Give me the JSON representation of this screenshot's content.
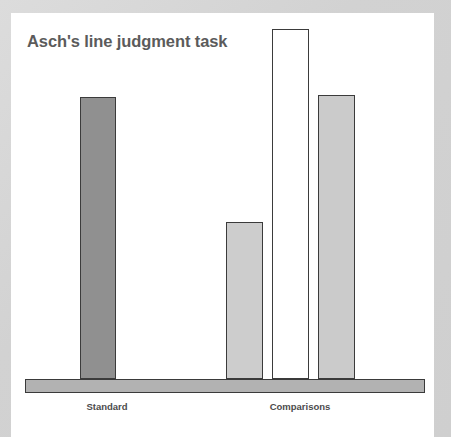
{
  "figure": {
    "title": "Asch's line judgment task",
    "title_color": "#5b5b5b",
    "card_background": "#ffffff",
    "page_background": "#d6d6d6"
  },
  "labels": {
    "standard": "Standard",
    "comparisons": "Comparisons"
  },
  "chart_data": {
    "type": "bar",
    "title": "Asch's line judgment task",
    "xlabel": "",
    "ylabel": "",
    "grid": false,
    "legend": "none",
    "groups": [
      {
        "name": "Standard",
        "label": "Standard",
        "bar_indices": [
          0
        ]
      },
      {
        "name": "Comparisons",
        "label": "Comparisons",
        "bar_indices": [
          1,
          2,
          3
        ]
      }
    ],
    "categories": [
      "Standard line",
      "Comparison 1",
      "Comparison 2",
      "Comparison 3"
    ],
    "values": [
      282,
      157,
      350,
      284
    ],
    "ylim": [
      0,
      366
    ],
    "bars": [
      {
        "index": 0,
        "group": "Standard",
        "value": 282,
        "fill": "#909090",
        "stroke": "#3b3b3b",
        "x": 69,
        "width": 36,
        "top": 84,
        "height": 282
      },
      {
        "index": 1,
        "group": "Comparisons",
        "value": 157,
        "fill": "#cdcdcd",
        "stroke": "#3b3b3b",
        "x": 215,
        "width": 37,
        "top": 209,
        "height": 157
      },
      {
        "index": 2,
        "group": "Comparisons",
        "value": 350,
        "fill": "#ffffff",
        "stroke": "#3b3b3b",
        "x": 261,
        "width": 37,
        "top": 16,
        "height": 350
      },
      {
        "index": 3,
        "group": "Comparisons",
        "value": 284,
        "fill": "#cbcbcb",
        "stroke": "#3b3b3b",
        "x": 307,
        "width": 37,
        "top": 82,
        "height": 284
      }
    ],
    "baseline": {
      "fill": "#b2b2b2",
      "stroke": "#3a3a3a",
      "x": 14,
      "width": 400,
      "top": 366,
      "height": 14
    }
  }
}
